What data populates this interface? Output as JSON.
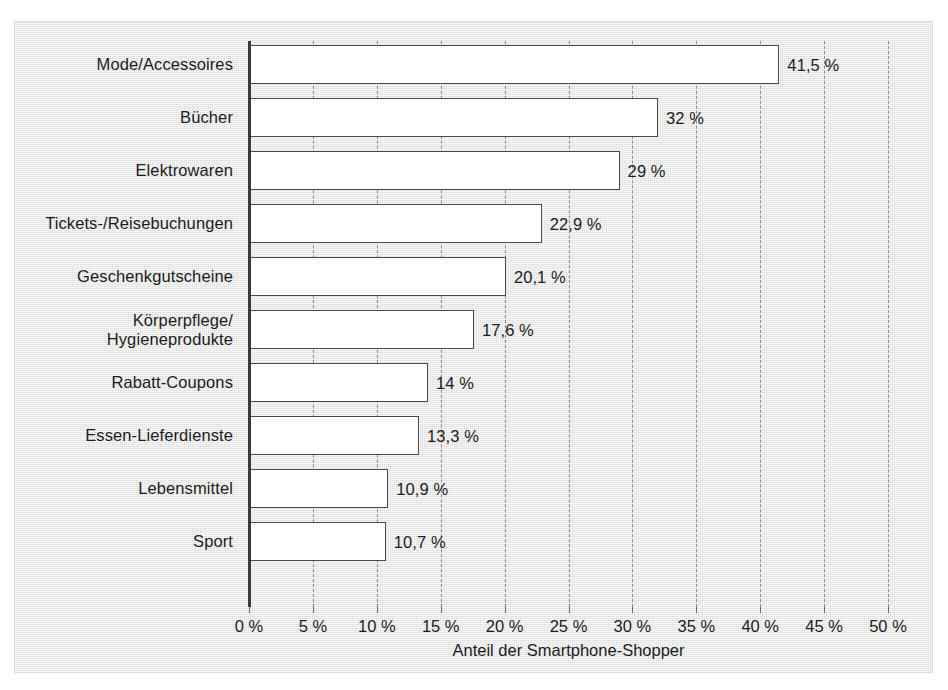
{
  "chart_data": {
    "type": "bar",
    "orientation": "horizontal",
    "title": "",
    "xlabel": "Anteil der Smartphone-Shopper",
    "ylabel": "",
    "xlim": [
      0,
      50
    ],
    "xtick_labels": [
      "0 %",
      "5 %",
      "10 %",
      "15 %",
      "20 %",
      "25 %",
      "30 %",
      "35 %",
      "40 %",
      "45 %",
      "50 %"
    ],
    "xticks": [
      0,
      5,
      10,
      15,
      20,
      25,
      30,
      35,
      40,
      45,
      50
    ],
    "grid": "vertical-dashed",
    "legend": "none",
    "categories": [
      "Mode/Accessoires",
      "Bücher",
      "Elektrowaren",
      "Tickets-/Reisebuchungen",
      "Geschenkgutscheine",
      "Körperpflege/\nHygieneprodukte",
      "Rabatt-Coupons",
      "Essen-Lieferdienste",
      "Lebensmittel",
      "Sport"
    ],
    "values": [
      41.5,
      32,
      29,
      22.9,
      20.1,
      17.6,
      14,
      13.3,
      10.9,
      10.7
    ],
    "value_labels": [
      "41,5 %",
      "32 %",
      "29 %",
      "22,9 %",
      "20,1 %",
      "17,6 %",
      "14 %",
      "13,3 %",
      "10,9 %",
      "10,7 %"
    ],
    "bars": [
      {
        "category": "Mode/Accessoires",
        "category_lines": [
          "Mode/Accessoires"
        ],
        "value": 41.5,
        "value_label": "41,5 %"
      },
      {
        "category": "Bücher",
        "category_lines": [
          "Bücher"
        ],
        "value": 32,
        "value_label": "32 %"
      },
      {
        "category": "Elektrowaren",
        "category_lines": [
          "Elektrowaren"
        ],
        "value": 29,
        "value_label": "29 %"
      },
      {
        "category": "Tickets-/Reisebuchungen",
        "category_lines": [
          "Tickets-/Reisebuchungen"
        ],
        "value": 22.9,
        "value_label": "22,9 %"
      },
      {
        "category": "Geschenkgutscheine",
        "category_lines": [
          "Geschenkgutscheine"
        ],
        "value": 20.1,
        "value_label": "20,1 %"
      },
      {
        "category": "Körperpflege/Hygieneprodukte",
        "category_lines": [
          "Körperpflege/",
          "Hygieneprodukte"
        ],
        "value": 17.6,
        "value_label": "17,6 %"
      },
      {
        "category": "Rabatt-Coupons",
        "category_lines": [
          "Rabatt-Coupons"
        ],
        "value": 14,
        "value_label": "14 %"
      },
      {
        "category": "Essen-Lieferdienste",
        "category_lines": [
          "Essen-Lieferdienste"
        ],
        "value": 13.3,
        "value_label": "13,3 %"
      },
      {
        "category": "Lebensmittel",
        "category_lines": [
          "Lebensmittel"
        ],
        "value": 10.9,
        "value_label": "10,9 %"
      },
      {
        "category": "Sport",
        "category_lines": [
          "Sport"
        ],
        "value": 10.7,
        "value_label": "10,7 %"
      }
    ],
    "colors": {
      "panel_background": "#e4e4e4",
      "bar_fill": "#ffffff",
      "bar_outline": "#4a4a4a",
      "axis": "#3a3a3a",
      "gridline": "#8d8d8d",
      "text": "#1c1c1c"
    }
  }
}
